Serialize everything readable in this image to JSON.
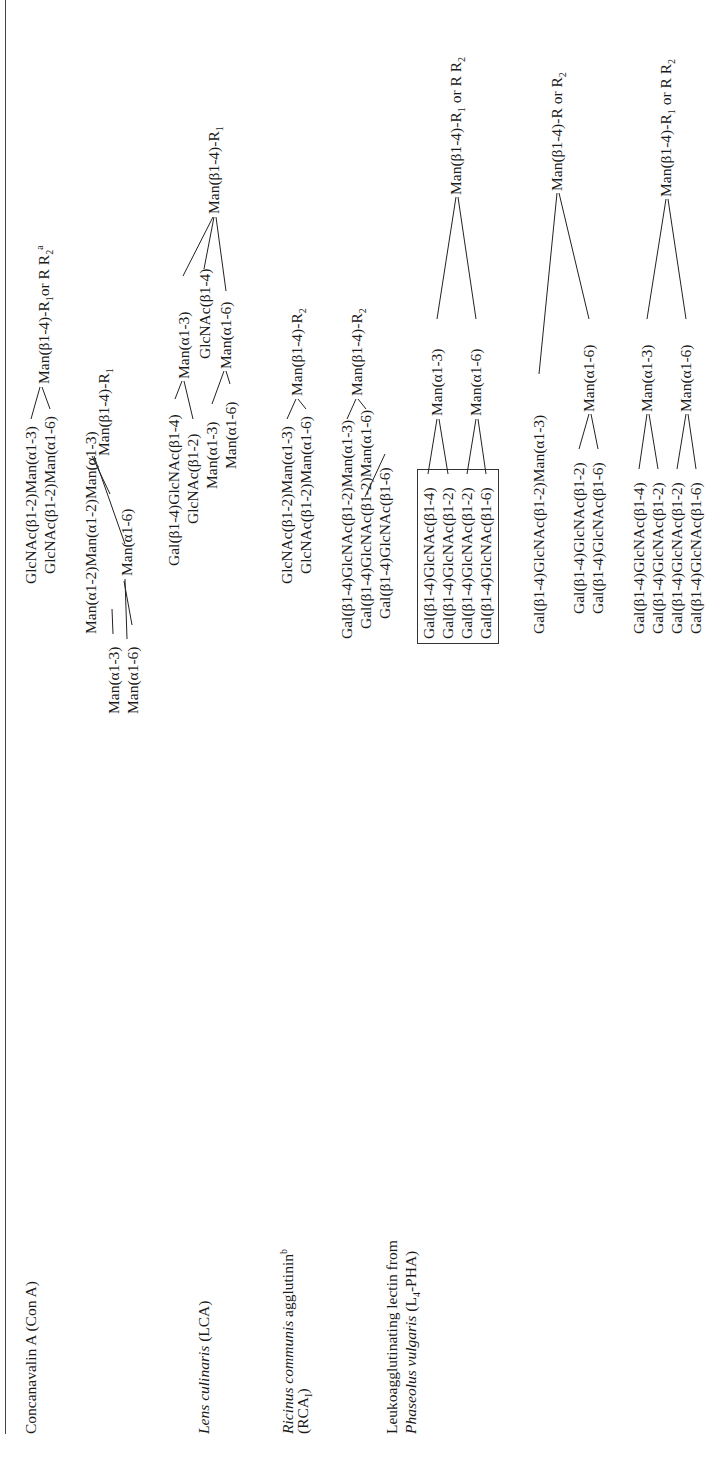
{
  "lectins": [
    {
      "name": "Concanavalin A (Con A)",
      "structures": [
        {
          "branches": [
            "GlcNAc(β1-2)Man(α1-3)",
            "GlcNAc(β1-2)Man(α1-6)"
          ],
          "core": "Man(β1-4)-R",
          "core_sub": "1",
          "core_tail": "or R",
          "core_tail_sub": "2",
          "footnote": "a"
        },
        {
          "branches": [
            "Man(α1-2)Man(α1-2)Man(α1-3)",
            "Man(α1-3)",
            "Man(α1-6)",
            "Man(α1-6)"
          ],
          "core": "Man(β1-4)-R",
          "core_sub": "1"
        },
        {
          "branches": [
            "Gal(β1-4)GlcNAc(β1-4)",
            "GlcNAc(β1-2)",
            "Man(α1-3)",
            "Man(α1-6)",
            "Man(α1-3)",
            "GlcNAc(β1-4)",
            "Man(α1-6)"
          ],
          "core": "Man(β1-4)-R",
          "core_sub": "1"
        }
      ]
    },
    {
      "name": "Lens culinaris",
      "abbr": "(LCA)",
      "structures": [
        {
          "branches": [
            "GlcNAc(β1-2)Man(α1-3)",
            "GlcNAc(β1-2)Man(α1-6)"
          ],
          "core": "Man(β1-4)-R",
          "core_sub": "2"
        },
        {
          "branches": [
            "Gal(β1-4)GlcNAc(β1-2)Man(α1-3)",
            "Gal(β1-4)GlcNAc(β1-2)Man(α1-6)",
            "Gal(β1-4)GlcNAc(β1-6)"
          ],
          "core": "Man(β1-4)-R",
          "core_sub": "2"
        }
      ]
    },
    {
      "name": "Ricinus communis",
      "name_rest": "agglutinin",
      "footnote": "b",
      "abbr": "(RCA",
      "abbr_sub": "I",
      "abbr_close": ")",
      "structures": [
        {
          "boxed_branches": [
            "Gal(β1-4)GlcNAc(β1-4)",
            "Gal(β1-4)GlcNAc(β1-2)",
            "Gal(β1-4)GlcNAc(β1-2)",
            "Gal(β1-4)GlcNAc(β1-6)"
          ],
          "mid": [
            "Man(α1-3)",
            "Man(α1-6)"
          ],
          "core": "Man(β1-4)-R",
          "core_sub": "1",
          "core_tail": "or R",
          "core_tail_sub": "2"
        }
      ]
    },
    {
      "name_line1": "Leukoagglutinating lectin from",
      "name_line2_italic": "Phaseolus vulgaris",
      "name_line2_rest": "(L",
      "name_line2_sub": "4",
      "name_line2_close": "-PHA)",
      "structures": [
        {
          "branches": [
            "Gal(β1-4)GlcNAc(β1-2)Man(α1-3)",
            "Gal(β1-4)GlcNAc(β1-2)",
            "Gal(β1-4)GlcNAc(β1-6)"
          ],
          "mid": [
            "Man(α1-6)"
          ],
          "core": "Man(β1-4)-R or R",
          "core_tail_sub": "2"
        },
        {
          "branches": [
            "Gal(β1-4)GlcNAc(β1-4)",
            "Gal(β1-4)GlcNAc(β1-2)",
            "Gal(β1-4)GlcNAc(β1-2)",
            "Gal(β1-4)GlcNAc(β1-6)"
          ],
          "mid": [
            "Man(α1-3)",
            "Man(α1-6)"
          ],
          "core": "Man(β1-4)-R",
          "core_sub": "1",
          "core_tail": "or R",
          "core_tail_sub": "2"
        }
      ]
    }
  ]
}
